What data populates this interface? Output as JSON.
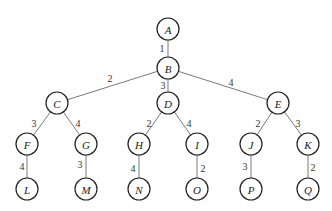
{
  "diagram": {
    "type": "weighted-tree",
    "node_radius": 11,
    "nodes": [
      {
        "id": "A",
        "label": "A",
        "x": 168,
        "y": 29
      },
      {
        "id": "B",
        "label": "B",
        "x": 168,
        "y": 68
      },
      {
        "id": "C",
        "label": "C",
        "x": 57,
        "y": 103
      },
      {
        "id": "D",
        "label": "D",
        "x": 168,
        "y": 103
      },
      {
        "id": "E",
        "label": "E",
        "x": 278,
        "y": 103
      },
      {
        "id": "F",
        "label": "F",
        "x": 27,
        "y": 144
      },
      {
        "id": "G",
        "label": "G",
        "x": 86,
        "y": 144
      },
      {
        "id": "H",
        "label": "H",
        "x": 139,
        "y": 144
      },
      {
        "id": "I",
        "label": "I",
        "x": 197,
        "y": 144
      },
      {
        "id": "J",
        "label": "J",
        "x": 251,
        "y": 144
      },
      {
        "id": "K",
        "label": "K",
        "x": 308,
        "y": 144
      },
      {
        "id": "L",
        "label": "L",
        "x": 27,
        "y": 189
      },
      {
        "id": "M",
        "label": "M",
        "x": 86,
        "y": 189
      },
      {
        "id": "N",
        "label": "N",
        "x": 139,
        "y": 189
      },
      {
        "id": "O",
        "label": "O",
        "x": 197,
        "y": 189
      },
      {
        "id": "P",
        "label": "P",
        "x": 251,
        "y": 189
      },
      {
        "id": "Q",
        "label": "Q",
        "x": 308,
        "y": 189
      }
    ],
    "edges": [
      {
        "from": "A",
        "to": "B",
        "weight": "1",
        "lx": 162,
        "ly": 48
      },
      {
        "from": "B",
        "to": "C",
        "weight": "2",
        "lx": 110,
        "ly": 78
      },
      {
        "from": "B",
        "to": "D",
        "weight": "3",
        "lx": 163,
        "ly": 85
      },
      {
        "from": "B",
        "to": "E",
        "weight": "4",
        "lx": 231,
        "ly": 82
      },
      {
        "from": "C",
        "to": "F",
        "weight": "3",
        "lx": 34,
        "ly": 123
      },
      {
        "from": "C",
        "to": "G",
        "weight": "4",
        "lx": 78,
        "ly": 123
      },
      {
        "from": "D",
        "to": "H",
        "weight": "2",
        "lx": 149,
        "ly": 123
      },
      {
        "from": "D",
        "to": "I",
        "weight": "4",
        "lx": 189,
        "ly": 123
      },
      {
        "from": "E",
        "to": "J",
        "weight": "2",
        "lx": 258,
        "ly": 123
      },
      {
        "from": "E",
        "to": "K",
        "weight": "3",
        "lx": 298,
        "ly": 123
      },
      {
        "from": "F",
        "to": "L",
        "weight": "4",
        "lx": 22,
        "ly": 166
      },
      {
        "from": "G",
        "to": "M",
        "weight": "3",
        "lx": 80,
        "ly": 164
      },
      {
        "from": "H",
        "to": "N",
        "weight": "4",
        "lx": 133,
        "ly": 168
      },
      {
        "from": "I",
        "to": "O",
        "weight": "2",
        "lx": 203,
        "ly": 168
      },
      {
        "from": "J",
        "to": "P",
        "weight": "3",
        "lx": 245,
        "ly": 166
      },
      {
        "from": "K",
        "to": "Q",
        "weight": "2",
        "lx": 313,
        "ly": 167
      }
    ]
  }
}
